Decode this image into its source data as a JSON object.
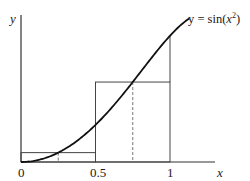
{
  "chart_data": {
    "type": "line",
    "title": "",
    "function_label": "y = sin(x²)",
    "function_label_parts": {
      "prefix": "y = sin(",
      "var": "x",
      "sup": "2",
      "suffix": ")"
    },
    "xlabel": "x",
    "ylabel": "y",
    "x_ticks": [
      "0",
      "0.5",
      "1"
    ],
    "x_tick_values": [
      0,
      0.5,
      1
    ],
    "xlim": [
      0,
      1.15
    ],
    "ylim": [
      0,
      1.0
    ],
    "grid": false,
    "series": [
      {
        "name": "y = sin(x^2)",
        "x_range": [
          0,
          1.13
        ],
        "function": "sin(x^2)"
      }
    ],
    "rectangles": [
      {
        "x0": 0,
        "x1": 0.5,
        "height": 0.0625,
        "midpoint": 0.25
      },
      {
        "x0": 0.5,
        "x1": 1.0,
        "height": 0.533,
        "midpoint": 0.75
      }
    ],
    "annotations": [
      "Midpoint rule rectangles with dashed lines at x = 0.25 and x = 0.75"
    ]
  },
  "colors": {
    "curve": "#111111",
    "axes": "#333333",
    "rect": "#444444",
    "dash": "#777777"
  }
}
